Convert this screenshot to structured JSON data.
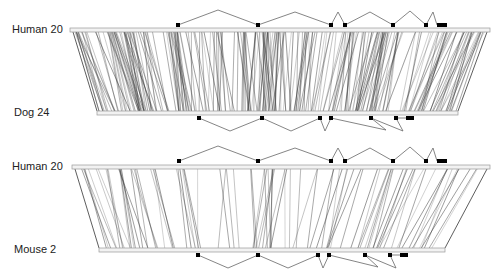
{
  "panels": [
    {
      "name": "human-dog",
      "top_label": "Human 20",
      "bottom_label": "Dog 24",
      "top_bar": {
        "x1": 70,
        "x2": 490,
        "y": 30
      },
      "bottom_bar": {
        "x1": 97,
        "x2": 458,
        "y": 113
      },
      "top_gene": {
        "baseline": 25,
        "exons": [
          178,
          258,
          331,
          345,
          393,
          426
        ],
        "last_exon": [
          437,
          447
        ],
        "peaks": [
          [
            218,
            10
          ],
          [
            295,
            12
          ],
          [
            338,
            12
          ],
          [
            370,
            12
          ],
          [
            410,
            11
          ],
          [
            433,
            12
          ]
        ]
      },
      "bottom_gene": {
        "baseline": 118,
        "exons": [
          199,
          262,
          320,
          331,
          371,
          396
        ],
        "last_exon": [
          406,
          414
        ],
        "valleys": [
          [
            230,
            131
          ],
          [
            291,
            131
          ],
          [
            325,
            131
          ],
          [
            386,
            130
          ],
          [
            403,
            131
          ]
        ]
      },
      "density": "dense"
    },
    {
      "name": "human-mouse",
      "top_label": "Human 20",
      "bottom_label": "Mouse 2",
      "top_bar": {
        "x1": 72,
        "x2": 490,
        "y": 167
      },
      "bottom_bar": {
        "x1": 99,
        "x2": 445,
        "y": 250
      },
      "top_gene": {
        "baseline": 161,
        "exons": [
          179,
          258,
          331,
          345,
          393,
          426
        ],
        "last_exon": [
          437,
          447
        ],
        "peaks": [
          [
            218,
            146
          ],
          [
            295,
            148
          ],
          [
            338,
            148
          ],
          [
            370,
            148
          ],
          [
            410,
            147
          ],
          [
            433,
            148
          ]
        ]
      },
      "bottom_gene": {
        "baseline": 255,
        "exons": [
          198,
          258,
          318,
          329,
          365,
          390
        ],
        "last_exon": [
          400,
          408
        ],
        "valleys": [
          [
            228,
            268
          ],
          [
            288,
            268
          ],
          [
            323,
            268
          ],
          [
            378,
            267
          ],
          [
            396,
            268
          ]
        ]
      },
      "density": "sparse"
    }
  ],
  "colors": {
    "line": "#555555",
    "bar": "#999999",
    "exon": "#000000",
    "intron": "#666666"
  }
}
